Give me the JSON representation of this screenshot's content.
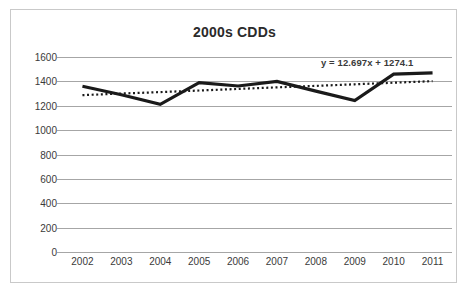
{
  "chart_data": {
    "type": "line",
    "title": "2000s CDDs",
    "xlabel": "",
    "ylabel": "",
    "ylim": [
      0,
      1600
    ],
    "yticks": [
      0,
      200,
      400,
      600,
      800,
      1000,
      1200,
      1400,
      1600
    ],
    "ytick_labels": [
      "0",
      "200",
      "400",
      "600",
      "800",
      "1000",
      "1200",
      "1400",
      "1600"
    ],
    "grid": true,
    "legend": "none",
    "categories": [
      "2002",
      "2003",
      "2004",
      "2005",
      "2006",
      "2007",
      "2008",
      "2009",
      "2010",
      "2011"
    ],
    "x": [
      2002,
      2003,
      2004,
      2005,
      2006,
      2007,
      2008,
      2009,
      2010,
      2011
    ],
    "series": [
      {
        "name": "CDDs",
        "style": "solid",
        "color": "#1a1a1a",
        "width": 3.2,
        "values": [
          1360,
          1290,
          1212,
          1390,
          1362,
          1400,
          1320,
          1242,
          1460,
          1470
        ]
      },
      {
        "name": "Linear (CDDs)",
        "style": "dotted",
        "color": "#1a1a1a",
        "width": 2.2,
        "values": [
          1287,
          1300,
          1312,
          1325,
          1338,
          1351,
          1363,
          1376,
          1389,
          1402
        ]
      }
    ],
    "annotations": [
      {
        "name": "trendline-equation",
        "text": "y = 12.697x + 1274.1"
      }
    ]
  },
  "colors": {
    "gridline": "#a6a6a6",
    "frame_border": "#c9c9c9",
    "series_line": "#1a1a1a",
    "text": "#3a3a3a",
    "title": "#2b2b2b",
    "background": "#ffffff"
  }
}
